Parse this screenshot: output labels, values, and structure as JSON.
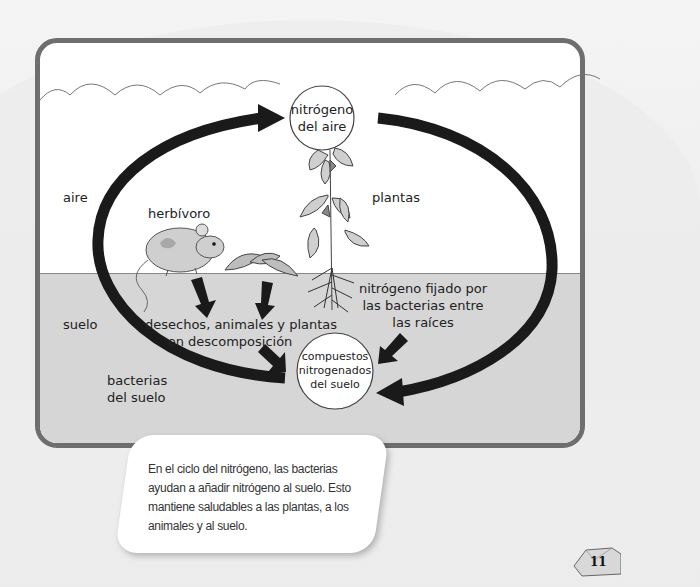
{
  "diagram": {
    "title": "Ciclo del nitrógeno",
    "zones": {
      "air_label": "aire",
      "soil_label": "suelo"
    },
    "nodes": {
      "nitrogen_air": [
        "nitrógeno",
        "del aire"
      ],
      "soil_compounds": [
        "compuestos",
        "nitrogenados",
        "del suelo"
      ]
    },
    "labels": {
      "herbivore": "herbívoro",
      "plants": "plantas",
      "fixed_nitrogen": [
        "nitrógeno fijado por",
        "las bacterias entre",
        "las raíces"
      ],
      "decomposition": [
        "desechos, animales y plantas",
        "en descomposición"
      ],
      "soil_bacteria": [
        "bacterias",
        "del suelo"
      ]
    },
    "icons": [
      "mouse-illustration",
      "plant-illustration",
      "leaves-illustration",
      "cloud-line",
      "arrow"
    ]
  },
  "caption": {
    "text": "En el ciclo del nitrógeno, las bacterias ayudan a añadir nitrógeno al suelo. Esto mantiene saludables a las plantas, a los animales y al suelo."
  },
  "page": {
    "number": "11"
  },
  "colors": {
    "frame": "#6e6e6e",
    "soil": "#d6d6d6",
    "arrow": "#1a1a1a",
    "background": "#efefef"
  }
}
